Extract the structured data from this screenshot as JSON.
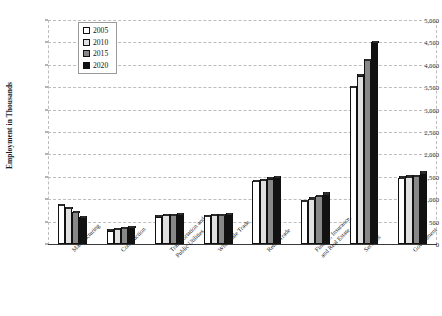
{
  "chart_data": {
    "type": "bar",
    "title": "",
    "xlabel": "",
    "ylabel": "Employment in Thousands",
    "ylim": [
      0,
      5000
    ],
    "ytick_labels": [
      "5,000",
      "4,500",
      "4,000",
      "3,500",
      "3,000",
      "2,500",
      "2,000",
      "1,500",
      "1,000",
      "500",
      "0"
    ],
    "ytick_values": [
      5000,
      4500,
      4000,
      3500,
      3000,
      2500,
      2000,
      1500,
      1000,
      500,
      0
    ],
    "grid": true,
    "legend_position": "upper-left",
    "categories": [
      "Manufacturing",
      "Construction",
      "Transportation and Public Utilities",
      "Wholesale Trade",
      "Retail Trade",
      "Finance, Insurance, and Real Estate",
      "Services",
      "Government"
    ],
    "category_lines": [
      [
        "Manufacturing"
      ],
      [
        "Construction"
      ],
      [
        "Transportation and",
        "Public Utilities"
      ],
      [
        "Wholesale Trade"
      ],
      [
        "Retail Trade"
      ],
      [
        "Finance, Insurance,",
        "and Real Estate"
      ],
      [
        "Services"
      ],
      [
        "Government"
      ]
    ],
    "series": [
      {
        "name": "2005",
        "color": "#ffffff",
        "values": [
          860,
          300,
          610,
          620,
          1400,
          950,
          3500,
          1480
        ]
      },
      {
        "name": "2010",
        "color": "#e0e0e0",
        "values": [
          800,
          330,
          640,
          640,
          1430,
          1010,
          3760,
          1500
        ]
      },
      {
        "name": "2015",
        "color": "#888888",
        "values": [
          710,
          355,
          650,
          650,
          1460,
          1070,
          4100,
          1520
        ]
      },
      {
        "name": "2020",
        "color": "#111111",
        "values": [
          600,
          380,
          670,
          660,
          1490,
          1120,
          4500,
          1590
        ]
      }
    ]
  },
  "legend": {
    "entries": [
      {
        "label": "2005"
      },
      {
        "label": "2010"
      },
      {
        "label": "2015"
      },
      {
        "label": "2020"
      }
    ]
  }
}
